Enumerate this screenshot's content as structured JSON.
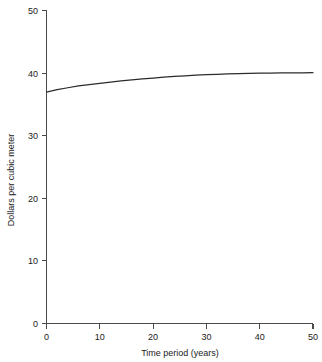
{
  "chart_data": {
    "type": "line",
    "title": "",
    "xlabel": "Time period (years)",
    "ylabel": "Dollars per cubic meter",
    "xlim": [
      0,
      50
    ],
    "ylim": [
      0,
      50
    ],
    "xticks": [
      0,
      10,
      20,
      30,
      40,
      50
    ],
    "yticks": [
      0,
      10,
      20,
      30,
      40,
      50
    ],
    "xtick_labels": [
      "0",
      "10",
      "20",
      "30",
      "40",
      "50"
    ],
    "ytick_labels": [
      "0",
      "10",
      "20",
      "30",
      "40",
      "50"
    ],
    "grid": false,
    "legend": false,
    "legend_position": "none",
    "series": [
      {
        "name": "Dollars per cubic meter",
        "color": "#2b2b2b",
        "x": [
          0,
          2,
          4,
          6,
          8,
          10,
          12,
          14,
          16,
          18,
          20,
          22,
          24,
          26,
          28,
          30,
          32,
          34,
          36,
          38,
          40,
          42,
          44,
          46,
          48,
          50
        ],
        "values": [
          36.9,
          37.3,
          37.6,
          37.9,
          38.1,
          38.3,
          38.5,
          38.7,
          38.85,
          39.0,
          39.15,
          39.3,
          39.4,
          39.5,
          39.6,
          39.7,
          39.75,
          39.8,
          39.85,
          39.9,
          39.92,
          39.95,
          39.97,
          39.98,
          39.99,
          40.0
        ]
      }
    ]
  },
  "axes": {
    "y_title": "Dollars per cubic meter",
    "x_title": "Time period (years)"
  },
  "ticks": {
    "y": [
      "50",
      "40",
      "30",
      "20",
      "10",
      "0"
    ],
    "x": [
      "0",
      "10",
      "20",
      "30",
      "40",
      "50"
    ]
  }
}
